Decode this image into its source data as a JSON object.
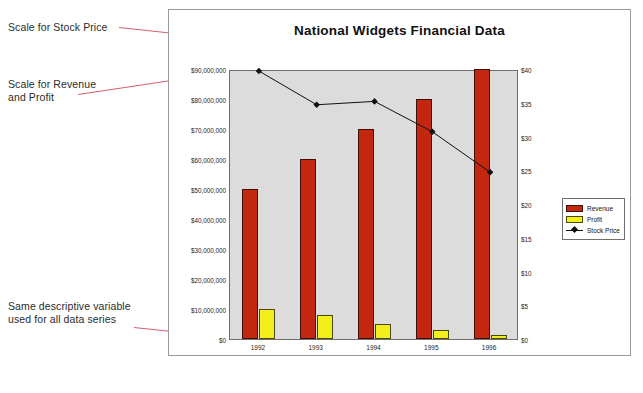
{
  "annotations": [
    {
      "id": "scale-stock-price",
      "text": "Scale for Stock Price"
    },
    {
      "id": "scale-revenue-profit",
      "text": "Scale for Revenue\nand Profit"
    },
    {
      "id": "same-descriptive-variable",
      "text": "Same descriptive variable\nused for all data series"
    }
  ],
  "colors": {
    "revenue": "#c4270f",
    "profit": "#f2ef1b",
    "stock_price_line": "#111111",
    "plot_background": "#dcdcdc",
    "annotation_leader": "#d4616b"
  },
  "legend": {
    "items": [
      {
        "label": "Revenue",
        "type": "bar"
      },
      {
        "label": "Profit",
        "type": "bar"
      },
      {
        "label": "Stock Price",
        "type": "line-marker"
      }
    ]
  },
  "chart_data": {
    "type": "bar",
    "title": "National Widgets Financial Data",
    "xlabel": "",
    "ylabel": "",
    "categories": [
      "1992",
      "1993",
      "1994",
      "1995",
      "1996"
    ],
    "grid": false,
    "legend_position": "right",
    "series": [
      {
        "name": "Revenue",
        "type": "bar",
        "axis": "left",
        "values": [
          50000000,
          60000000,
          70000000,
          80000000,
          90000000
        ]
      },
      {
        "name": "Profit",
        "type": "bar",
        "axis": "left",
        "values": [
          10000000,
          8000000,
          5000000,
          3000000,
          1500000
        ]
      },
      {
        "name": "Stock Price",
        "type": "line",
        "axis": "right",
        "values": [
          40,
          35,
          35.5,
          31,
          25
        ]
      }
    ],
    "yaxis_left": {
      "label": "",
      "ylim": [
        0,
        90000000
      ],
      "ticks": [
        "$0",
        "$10,000,000",
        "$20,000,000",
        "$30,000,000",
        "$40,000,000",
        "$50,000,000",
        "$60,000,000",
        "$70,000,000",
        "$80,000,000",
        "$90,000,000"
      ],
      "tick_values": [
        0,
        10000000,
        20000000,
        30000000,
        40000000,
        50000000,
        60000000,
        70000000,
        80000000,
        90000000
      ]
    },
    "yaxis_right": {
      "label": "",
      "ylim": [
        0,
        40
      ],
      "ticks": [
        "$0",
        "$5",
        "$10",
        "$15",
        "$20",
        "$25",
        "$30",
        "$35",
        "$40"
      ],
      "tick_values": [
        0,
        5,
        10,
        15,
        20,
        25,
        30,
        35,
        40
      ]
    }
  }
}
